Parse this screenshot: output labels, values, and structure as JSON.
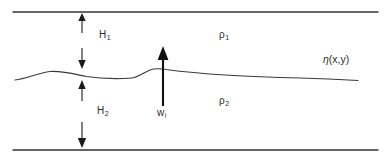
{
  "figure": {
    "width": 385,
    "height": 162,
    "background": "#ffffff",
    "line_color": "#333333",
    "text_color": "#2b2b2b"
  },
  "labels": {
    "h1": {
      "symbol": "H",
      "subscript": "1",
      "meaning": "upper-layer-thickness"
    },
    "h2": {
      "symbol": "H",
      "subscript": "2",
      "meaning": "lower-layer-thickness"
    },
    "wi": {
      "symbol": "w",
      "subscript": "i",
      "meaning": "interfacial-vertical-velocity"
    },
    "rho1": {
      "symbol": "ρ",
      "subscript": "1",
      "meaning": "upper-layer-density"
    },
    "rho2": {
      "symbol": "ρ",
      "subscript": "2",
      "meaning": "lower-layer-density"
    },
    "eta": {
      "symbol": "η",
      "argument": "(x,y)",
      "meaning": "interface-displacement"
    }
  },
  "geometry": {
    "top_boundary": {
      "y": 12,
      "x_start": 13,
      "x_end": 378
    },
    "bottom_boundary": {
      "y": 150,
      "x_start": 13,
      "x_end": 378
    },
    "interface_path": "M 15 80 C 26 79 38 73 50 71.5 C 62 70.5 74 74 86 76.5 C 100 78.5 118 79 132 78 C 138 77.5 143 73 150 70 C 155 68 160 68.5 166 69.5 C 200 74 250 77 300 78 C 322 78.5 342 79.5 358 80.5",
    "h1_upper_arrow": {
      "x": 82,
      "y_tail": 33,
      "y_head": 14,
      "direction": "up"
    },
    "h1_lower_arrow": {
      "x": 82,
      "y_tail": 48,
      "y_head": 68,
      "direction": "down"
    },
    "h2_upper_arrow": {
      "x": 82,
      "y_tail": 101,
      "y_head": 81,
      "direction": "up"
    },
    "h2_lower_arrow": {
      "x": 82,
      "y_tail": 122,
      "y_head": 148,
      "direction": "down"
    },
    "wi_arrow": {
      "x": 163,
      "y_tail": 106,
      "y_head": 47,
      "direction": "up"
    }
  }
}
